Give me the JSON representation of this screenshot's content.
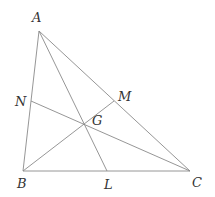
{
  "diagram": {
    "title": "",
    "type": "triangle-medians-centroid",
    "points": {
      "A": {
        "label": "A",
        "x": 39,
        "y": 31,
        "lx": 32,
        "ly": 22
      },
      "B": {
        "label": "B",
        "x": 23,
        "y": 171,
        "lx": 17,
        "ly": 188
      },
      "C": {
        "label": "C",
        "x": 190,
        "y": 171,
        "lx": 192,
        "ly": 187
      },
      "L": {
        "label": "L",
        "x": 107,
        "y": 171,
        "lx": 104,
        "ly": 189
      },
      "M": {
        "label": "M",
        "x": 114,
        "y": 101,
        "lx": 118,
        "ly": 101
      },
      "N": {
        "label": "N",
        "x": 31,
        "y": 101,
        "lx": 15,
        "ly": 106
      },
      "G": {
        "label": "G",
        "x": 84,
        "y": 119,
        "lx": 92,
        "ly": 125
      }
    },
    "segments": [
      {
        "name": "side-AB",
        "from": "A",
        "to": "B"
      },
      {
        "name": "side-BC",
        "from": "B",
        "to": "C"
      },
      {
        "name": "side-AC",
        "from": "A",
        "to": "C"
      },
      {
        "name": "median-AL",
        "from": "A",
        "to": "L"
      },
      {
        "name": "median-BM",
        "from": "B",
        "to": "M"
      },
      {
        "name": "median-CN",
        "from": "C",
        "to": "N"
      }
    ],
    "line_color": "#8a8a8a",
    "label_color": "#333333"
  }
}
